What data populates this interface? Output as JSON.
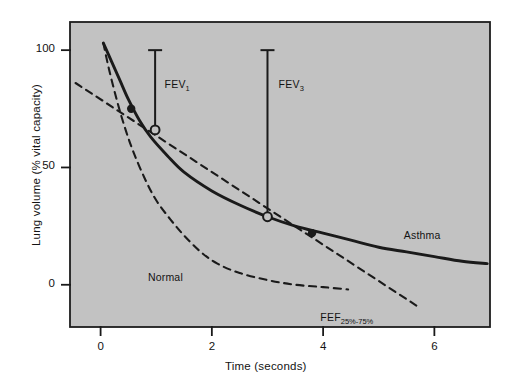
{
  "chart_data": {
    "type": "line",
    "title": "",
    "xlabel": "Time (seconds)",
    "ylabel": "Lung volume (% vital capacity)",
    "xlim": [
      -0.55,
      7.0
    ],
    "ylim": [
      -18,
      112
    ],
    "xticks": [
      0,
      2,
      4,
      6
    ],
    "yticks": [
      0,
      50,
      100
    ],
    "xtick_labels": [
      "0",
      "2",
      "4",
      "6"
    ],
    "ytick_labels": [
      "0",
      "50",
      "100"
    ],
    "grid": false,
    "legend": "inline-annotations",
    "background_color": "#c2c2c2",
    "line_color": "#1a1a1a",
    "series": [
      {
        "name": "Asthma",
        "style": "solid",
        "label": "Asthma",
        "label_x": 5.45,
        "label_y": 21,
        "points": [
          [
            0.05,
            103
          ],
          [
            0.2,
            95
          ],
          [
            0.35,
            87
          ],
          [
            0.5,
            79
          ],
          [
            0.7,
            70
          ],
          [
            0.9,
            63
          ],
          [
            1.2,
            55
          ],
          [
            1.5,
            48
          ],
          [
            2.0,
            40
          ],
          [
            2.5,
            34
          ],
          [
            3.0,
            29
          ],
          [
            3.5,
            25
          ],
          [
            4.0,
            22
          ],
          [
            4.5,
            19
          ],
          [
            5.0,
            16
          ],
          [
            5.5,
            14
          ],
          [
            6.0,
            12
          ],
          [
            6.5,
            10
          ],
          [
            6.95,
            9
          ]
        ]
      },
      {
        "name": "Normal",
        "style": "dashed",
        "label": "Normal",
        "label_x": 0.85,
        "label_y": 3,
        "points": [
          [
            0.05,
            103
          ],
          [
            0.15,
            92
          ],
          [
            0.3,
            78
          ],
          [
            0.45,
            66
          ],
          [
            0.6,
            56
          ],
          [
            0.8,
            45
          ],
          [
            1.0,
            36
          ],
          [
            1.25,
            28
          ],
          [
            1.5,
            21
          ],
          [
            1.8,
            14
          ],
          [
            2.1,
            9
          ],
          [
            2.5,
            5
          ],
          [
            3.0,
            2
          ],
          [
            3.5,
            0
          ],
          [
            4.0,
            -1
          ],
          [
            4.45,
            -2
          ]
        ]
      },
      {
        "name": "FEF25%-75%",
        "style": "dashed",
        "label": "FEF",
        "label_sub": "25%-75%",
        "label_x": 3.95,
        "label_y": -14,
        "points": [
          [
            -0.45,
            86
          ],
          [
            5.75,
            -10
          ]
        ]
      }
    ],
    "markers": [
      {
        "name": "fef-lower-point",
        "x": 0.55,
        "y": 75,
        "style": "filled"
      },
      {
        "name": "fev1-point",
        "x": 0.98,
        "y": 66,
        "style": "open"
      },
      {
        "name": "fev3-point",
        "x": 3.0,
        "y": 29,
        "style": "open"
      },
      {
        "name": "fef-upper-point",
        "x": 3.8,
        "y": 22,
        "style": "filled"
      }
    ],
    "annotations": [
      {
        "name": "fev1-measure",
        "label": "FEV",
        "label_sub": "1",
        "x": 0.98,
        "y_top": 100,
        "y_bottom": 66,
        "label_x": 1.15,
        "label_y": 85
      },
      {
        "name": "fev3-measure",
        "label": "FEV",
        "label_sub": "3",
        "x": 3.0,
        "y_top": 100,
        "y_bottom": 29,
        "label_x": 3.2,
        "label_y": 85
      }
    ]
  },
  "axes": {
    "x_title": "Time (seconds)",
    "y_title": "Lung volume (% vital capacity)",
    "x_ticks": [
      "0",
      "2",
      "4",
      "6"
    ],
    "y_ticks": [
      "100",
      "50",
      "0"
    ]
  },
  "labels": {
    "asthma": "Asthma",
    "normal": "Normal",
    "fef_main": "FEF",
    "fef_sub": "25%-75%",
    "fev1_main": "FEV",
    "fev1_sub": "1",
    "fev3_main": "FEV",
    "fev3_sub": "3"
  }
}
